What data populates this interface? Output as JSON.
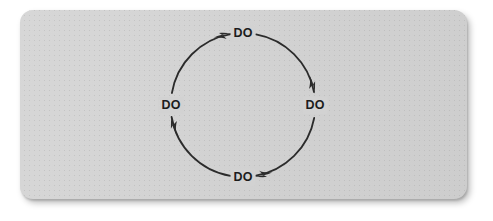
{
  "page": {
    "background_color": "#ffffff"
  },
  "panel": {
    "name": "diagram-card",
    "background_color": "#d2d2d2",
    "corner_radius_px": 13
  },
  "diagram": {
    "title": "",
    "type": "cycle",
    "direction": "clockwise",
    "stroke_color": "#2b2b2b",
    "label_color": "#1c1c1c",
    "circle": {
      "center_x": 243,
      "center_y": 105,
      "radius": 72,
      "stroke_width": 1.8
    },
    "nodes": [
      {
        "id": "node-top",
        "label": "DO",
        "position": "top",
        "x": 243,
        "y": 33
      },
      {
        "id": "node-right",
        "label": "DO",
        "position": "right",
        "x": 315,
        "y": 105
      },
      {
        "id": "node-bottom",
        "label": "DO",
        "position": "bottom",
        "x": 243,
        "y": 177
      },
      {
        "id": "node-left",
        "label": "DO",
        "position": "left",
        "x": 171,
        "y": 105
      }
    ],
    "arrows": [
      {
        "id": "arrow-top",
        "points_to": "node-top",
        "heading": "right"
      },
      {
        "id": "arrow-right",
        "points_to": "node-right",
        "heading": "down"
      },
      {
        "id": "arrow-bottom",
        "points_to": "node-bottom",
        "heading": "left"
      },
      {
        "id": "arrow-left",
        "points_to": "node-left",
        "heading": "up"
      }
    ]
  }
}
